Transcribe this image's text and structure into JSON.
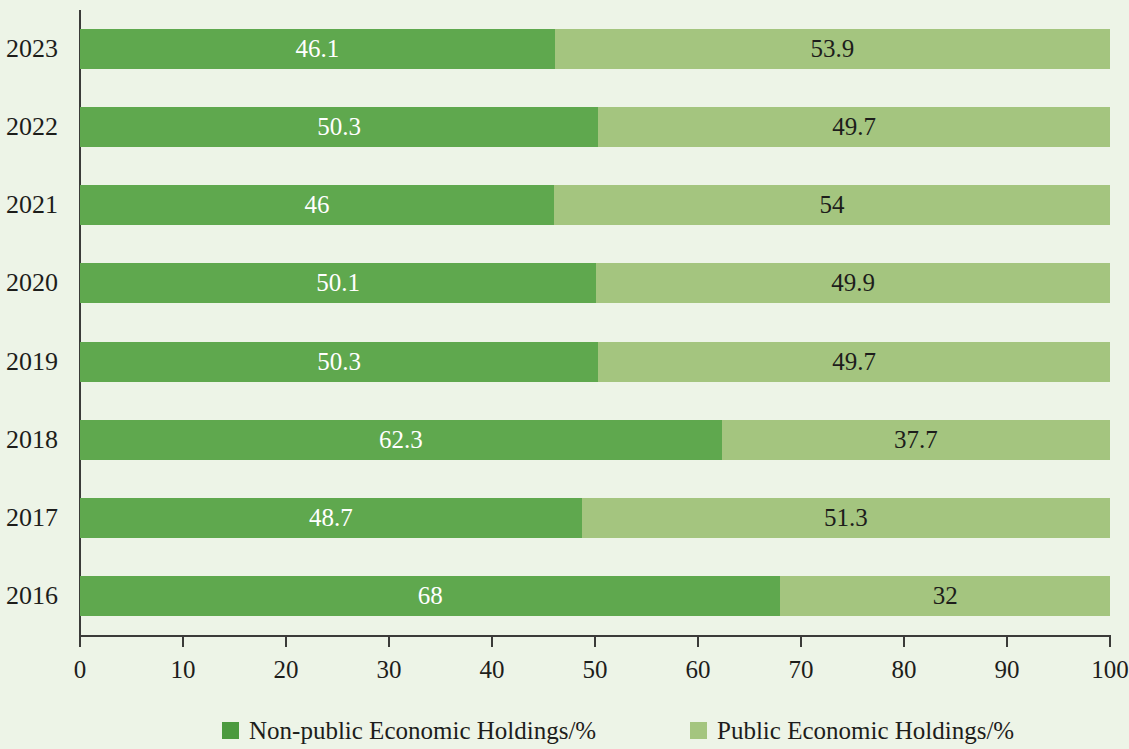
{
  "chart_data": {
    "type": "bar",
    "orientation": "horizontal",
    "stacked": true,
    "normalized": true,
    "title": "",
    "xlabel": "",
    "ylabel": "",
    "xlim": [
      0,
      100
    ],
    "grid": false,
    "legend_position": "bottom",
    "categories": [
      "2023",
      "2022",
      "2021",
      "2020",
      "2019",
      "2018",
      "2017",
      "2016"
    ],
    "x_ticks": [
      0,
      10,
      20,
      30,
      40,
      50,
      60,
      70,
      80,
      90,
      100
    ],
    "x_tick_labels": [
      "0",
      "10",
      "20",
      "30",
      "40",
      "50",
      "60",
      "70",
      "80",
      "90",
      "100"
    ],
    "series": [
      {
        "name": "Non-public Economic Holdings/%",
        "color": "#5fa84e",
        "values": [
          46.1,
          50.3,
          46,
          50.1,
          50.3,
          62.3,
          48.7,
          68
        ],
        "labels": [
          "46.1",
          "50.3",
          "46",
          "50.1",
          "50.3",
          "62.3",
          "48.7",
          "68"
        ]
      },
      {
        "name": "Public Economic Holdings/%",
        "color": "#a4c57f",
        "values": [
          53.9,
          49.7,
          54,
          49.9,
          49.7,
          37.7,
          51.3,
          32
        ],
        "labels": [
          "53.9",
          "49.7",
          "54",
          "49.9",
          "49.7",
          "37.7",
          "51.3",
          "32"
        ]
      }
    ]
  },
  "legend": {
    "items": [
      {
        "label": "Non-public Economic Holdings/%",
        "color": "#4c9a3f"
      },
      {
        "label": "Public Economic Holdings/%",
        "color": "#a4c57f"
      }
    ]
  },
  "colors": {
    "background": "#edf4e7",
    "axis": "#3b3b39",
    "nonpublic": "#5fa84e",
    "public": "#a4c57f",
    "text_dark": "#1d1d1b",
    "text_light": "#ffffff"
  }
}
